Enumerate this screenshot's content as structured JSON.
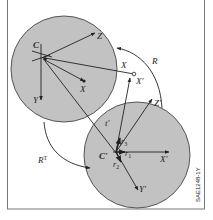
{
  "diagram": {
    "type": "coordinate-frame-transformation",
    "colors": {
      "circle_fill": "#c2c2c2",
      "circle_stroke": "#555555",
      "line": "#222222",
      "frame_border": "#777777",
      "background": "#ffffff"
    },
    "frame_a": {
      "origin_label": "C",
      "axis_x_label": "X",
      "axis_y_label": "Y",
      "axis_z_label": "Z",
      "point_label": "X"
    },
    "frame_b": {
      "origin_label": "C'",
      "axis_x_label": "X'",
      "axis_y_label": "Y'",
      "axis_z_label": "Z'",
      "translation_label": "t'",
      "basis_1": "r",
      "basis_1_sub": "1",
      "basis_2": "r",
      "basis_2_sub": "2",
      "basis_3": "r",
      "basis_3_sub": "3"
    },
    "shared_point_label": "X",
    "shared_point_prime_label": "X'",
    "rotation_label": "R",
    "rotation_transpose_label": "R",
    "rotation_transpose_sup": "T",
    "figure_code": "SAE1248-1Y"
  }
}
